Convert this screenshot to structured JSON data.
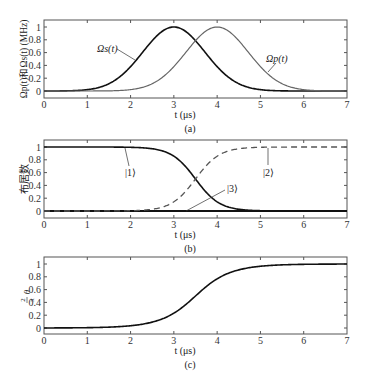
{
  "chart_data": [
    {
      "panel": "(a)",
      "type": "line",
      "xlabel": "t (μs)",
      "ylabel": "Ωp(t)和Ωs(t) (MHz)",
      "xlim": [
        0,
        7
      ],
      "ylim": [
        -0.1,
        1.1
      ],
      "xticks": [
        "0",
        "1",
        "2",
        "3",
        "4",
        "5",
        "6",
        "7"
      ],
      "yticks": [
        "0",
        "0.2",
        "0.4",
        "0.6",
        "0.8",
        "1"
      ],
      "grid": false,
      "series": [
        {
          "name": "Ωs(t)",
          "color": "#111111",
          "style": "solid",
          "peak_t": 3,
          "peak": 1.0,
          "sigma": 0.72,
          "x": [
            0,
            1,
            1.5,
            2,
            2.5,
            3,
            3.5,
            4,
            4.5,
            5,
            6,
            7
          ],
          "values": [
            0.0,
            0.02,
            0.11,
            0.38,
            0.79,
            1.0,
            0.79,
            0.38,
            0.11,
            0.02,
            0.0,
            0.0
          ]
        },
        {
          "name": "Ωp(t)",
          "color": "#666666",
          "style": "solid",
          "peak_t": 4,
          "peak": 1.0,
          "sigma": 0.72,
          "x": [
            0,
            1,
            2,
            2.5,
            3,
            3.5,
            4,
            4.5,
            5,
            5.5,
            6,
            7
          ],
          "values": [
            0.0,
            0.0,
            0.02,
            0.11,
            0.38,
            0.79,
            1.0,
            0.79,
            0.38,
            0.11,
            0.02,
            0.0
          ]
        }
      ],
      "annotations": [
        {
          "text": "Ωs(t)",
          "x": 1.05,
          "y": 0.8
        },
        {
          "text": "Ωp(t)",
          "x": 5.35,
          "y": 0.6
        }
      ]
    },
    {
      "panel": "(b)",
      "type": "line",
      "xlabel": "t (μs)",
      "ylabel": "布居数",
      "xlim": [
        0,
        7
      ],
      "ylim": [
        -0.1,
        1.1
      ],
      "xticks": [
        "0",
        "1",
        "2",
        "3",
        "4",
        "5",
        "6",
        "7"
      ],
      "yticks": [
        "0",
        "0.2",
        "0.4",
        "0.6",
        "0.8",
        "1"
      ],
      "grid": false,
      "series": [
        {
          "name": "|1⟩",
          "color": "#111111",
          "style": "solid",
          "x": [
            0,
            1,
            2,
            2.5,
            3,
            3.25,
            3.5,
            3.75,
            4,
            4.5,
            5,
            7
          ],
          "values": [
            1.0,
            1.0,
            1.0,
            0.97,
            0.85,
            0.7,
            0.5,
            0.3,
            0.15,
            0.03,
            0.0,
            0.0
          ]
        },
        {
          "name": "|2⟩",
          "color": "#555555",
          "style": "dashed",
          "x": [
            0,
            1,
            2,
            2.5,
            3,
            3.25,
            3.5,
            3.75,
            4,
            4.5,
            5,
            7
          ],
          "values": [
            0.0,
            0.0,
            0.0,
            0.03,
            0.15,
            0.3,
            0.5,
            0.7,
            0.85,
            0.97,
            1.0,
            1.0
          ]
        },
        {
          "name": "|3⟩",
          "color": "#111111",
          "style": "solid",
          "x": [
            0,
            7
          ],
          "values": [
            0.0,
            0.0
          ]
        }
      ],
      "annotations": [
        {
          "text": "|1⟩",
          "x": 2.0,
          "y": 0.65
        },
        {
          "text": "|2⟩",
          "x": 5.2,
          "y": 0.65
        },
        {
          "text": "|3⟩",
          "x": 4.4,
          "y": 0.35
        }
      ]
    },
    {
      "panel": "(c)",
      "type": "line",
      "xlabel": "t (μs)",
      "ylabel": "2θ/π",
      "xlim": [
        0,
        7
      ],
      "ylim": [
        -0.1,
        1.1
      ],
      "xticks": [
        "0",
        "1",
        "2",
        "3",
        "4",
        "5",
        "6",
        "7"
      ],
      "yticks": [
        "0",
        "0.2",
        "0.4",
        "0.6",
        "0.8",
        "1"
      ],
      "grid": false,
      "series": [
        {
          "name": "2θ/π",
          "color": "#111111",
          "style": "solid",
          "x": [
            0,
            1,
            2,
            2.5,
            3,
            3.25,
            3.5,
            3.75,
            4,
            4.5,
            5,
            6,
            7
          ],
          "values": [
            0.0,
            0.0,
            0.02,
            0.08,
            0.29,
            0.42,
            0.58,
            0.71,
            0.82,
            0.94,
            0.98,
            1.0,
            1.0
          ]
        }
      ]
    }
  ],
  "panels": {
    "a": {
      "caption": "(a)",
      "xlabel": "t (μs)",
      "ylabel": "Ωp(t)和Ωs(t) (MHz)",
      "label_s": "Ωs(t)",
      "label_p": "Ωp(t)"
    },
    "b": {
      "caption": "(b)",
      "xlabel": "t (μs)",
      "ylabel": "布居数",
      "label_1": "|1⟩",
      "label_2": "|2⟩",
      "label_3": "|3⟩"
    },
    "c": {
      "caption": "(c)",
      "xlabel": "t (μs)",
      "ylabel_num": "2",
      "ylabel_den": "π",
      "ylabel_var": "θ"
    }
  },
  "ticks": {
    "x": [
      "0",
      "1",
      "2",
      "3",
      "4",
      "5",
      "6",
      "7"
    ],
    "y": [
      "0",
      "0.2",
      "0.4",
      "0.6",
      "0.8",
      "1"
    ]
  }
}
